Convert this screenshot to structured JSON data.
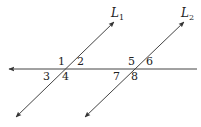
{
  "diagram": {
    "line_color": "#444444",
    "transversal": {
      "x1": 9,
      "y1": 69,
      "x2": 197,
      "y2": 69,
      "arrow_left": true
    },
    "lines": [
      {
        "id": "L1",
        "label": "L",
        "subscript": "1",
        "x1": 16,
        "y1": 117,
        "x2": 114,
        "y2": 22,
        "label_x": 111,
        "label_y": 17
      },
      {
        "id": "L2",
        "label": "L",
        "subscript": "2",
        "x1": 85,
        "y1": 117,
        "x2": 184,
        "y2": 22,
        "label_x": 181,
        "label_y": 17
      }
    ],
    "angles": [
      {
        "label": "1",
        "x": 58,
        "y": 65
      },
      {
        "label": "2",
        "x": 77,
        "y": 65
      },
      {
        "label": "3",
        "x": 43,
        "y": 80
      },
      {
        "label": "4",
        "x": 62,
        "y": 80
      },
      {
        "label": "5",
        "x": 128,
        "y": 65
      },
      {
        "label": "6",
        "x": 146,
        "y": 65
      },
      {
        "label": "7",
        "x": 113,
        "y": 80
      },
      {
        "label": "8",
        "x": 131,
        "y": 80
      }
    ]
  }
}
